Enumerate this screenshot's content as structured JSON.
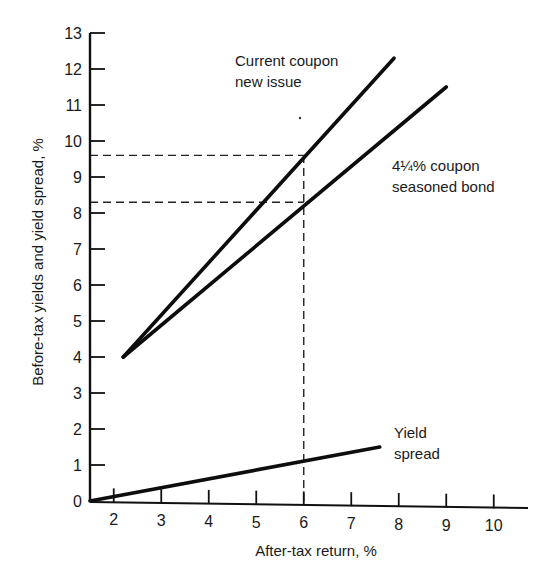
{
  "chart_data": {
    "type": "line",
    "title": "",
    "xlabel": "After-tax return, %",
    "ylabel": "Before-tax yields and yield spread, %",
    "xlim": [
      1.5,
      10.7
    ],
    "ylim": [
      0,
      13
    ],
    "x_ticks": [
      "2",
      "3",
      "4",
      "5",
      "6",
      "7",
      "8",
      "9",
      "10"
    ],
    "y_ticks": [
      "0",
      "1",
      "2",
      "3",
      "4",
      "5",
      "6",
      "7",
      "8",
      "9",
      "10",
      "11",
      "12",
      "13"
    ],
    "grid": false,
    "legend": "none (inline annotations)",
    "series": [
      {
        "name": "Current coupon new issue",
        "label_lines": [
          "Current coupon",
          "new issue"
        ],
        "points": [
          [
            2.2,
            4.0
          ],
          [
            7.9,
            12.3
          ]
        ]
      },
      {
        "name": "4¼% coupon seasoned bond",
        "label_lines": [
          "4¼% coupon",
          "seasoned bond"
        ],
        "points": [
          [
            2.2,
            4.0
          ],
          [
            9.0,
            11.5
          ]
        ]
      },
      {
        "name": "Yield spread",
        "label_lines": [
          "Yield",
          "spread"
        ],
        "points": [
          [
            1.5,
            0.0
          ],
          [
            7.6,
            1.5
          ]
        ]
      }
    ],
    "reference_lines": [
      {
        "type": "vertical-dashed",
        "x": 6,
        "from_y": 0,
        "to_y": 9.6
      },
      {
        "type": "horizontal-dashed",
        "y": 9.6,
        "from_x": 1.5,
        "to_x": 6
      },
      {
        "type": "horizontal-dashed",
        "y": 8.3,
        "from_x": 1.5,
        "to_x": 6
      }
    ]
  }
}
